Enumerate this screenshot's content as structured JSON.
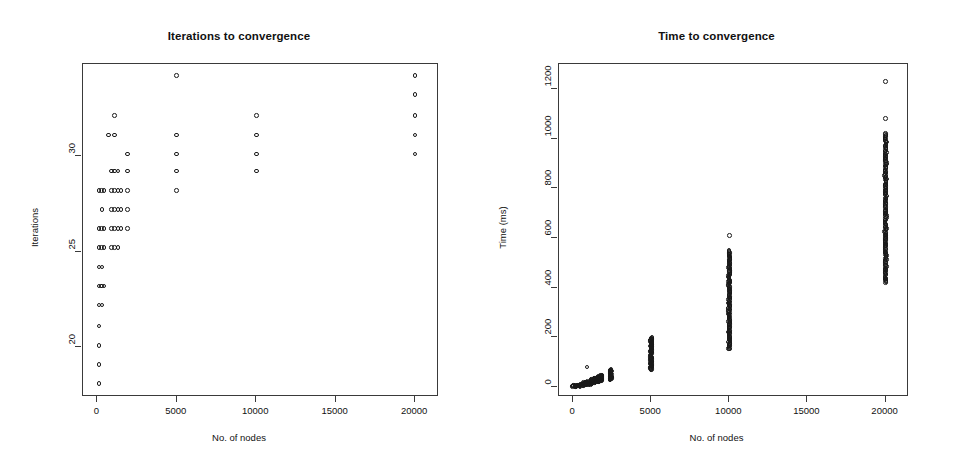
{
  "figure": {
    "background": "#ffffff",
    "point_color": "#191919",
    "axis_color": "#3a3a3a",
    "marker": "open-circle"
  },
  "chart_data": [
    {
      "type": "scatter",
      "title": "Iterations to convergence",
      "xlabel": "No. of nodes",
      "ylabel": "Iterations",
      "xlim": [
        -900,
        21500
      ],
      "ylim": [
        17.4,
        34.8
      ],
      "xticks": [
        0,
        5000,
        10000,
        15000,
        20000
      ],
      "xticklabels": [
        "0",
        "5000",
        "10000",
        "15000",
        "20000"
      ],
      "yticks": [
        20,
        25,
        30
      ],
      "yticklabels": [
        "20",
        "25",
        "30"
      ],
      "grid": false,
      "legend": null,
      "points": [
        [
          100,
          18.1
        ],
        [
          100,
          19.1
        ],
        [
          100,
          20.1
        ],
        [
          100,
          21.1
        ],
        [
          100,
          22.2
        ],
        [
          300,
          22.2
        ],
        [
          100,
          23.2
        ],
        [
          250,
          23.2
        ],
        [
          420,
          23.2
        ],
        [
          100,
          24.2
        ],
        [
          300,
          24.2
        ],
        [
          100,
          25.2
        ],
        [
          250,
          25.2
        ],
        [
          420,
          25.2
        ],
        [
          900,
          25.2
        ],
        [
          1100,
          25.2
        ],
        [
          1300,
          25.2
        ],
        [
          100,
          26.2
        ],
        [
          250,
          26.2
        ],
        [
          420,
          26.2
        ],
        [
          900,
          26.2
        ],
        [
          1100,
          26.2
        ],
        [
          1300,
          26.2
        ],
        [
          1500,
          26.2
        ],
        [
          1900,
          26.2
        ],
        [
          300,
          27.2
        ],
        [
          900,
          27.2
        ],
        [
          1100,
          27.2
        ],
        [
          1300,
          27.2
        ],
        [
          1500,
          27.2
        ],
        [
          1900,
          27.2
        ],
        [
          100,
          28.2
        ],
        [
          250,
          28.2
        ],
        [
          420,
          28.2
        ],
        [
          900,
          28.2
        ],
        [
          1100,
          28.2
        ],
        [
          1300,
          28.2
        ],
        [
          1500,
          28.2
        ],
        [
          1900,
          28.2
        ],
        [
          5000,
          28.2
        ],
        [
          900,
          29.2
        ],
        [
          1100,
          29.2
        ],
        [
          1300,
          29.2
        ],
        [
          1900,
          29.2
        ],
        [
          5000,
          29.2
        ],
        [
          10000,
          29.2
        ],
        [
          1900,
          30.1
        ],
        [
          5000,
          30.1
        ],
        [
          10000,
          30.1
        ],
        [
          20000,
          30.1
        ],
        [
          700,
          31.1
        ],
        [
          1100,
          31.1
        ],
        [
          5000,
          31.1
        ],
        [
          10000,
          31.1
        ],
        [
          20000,
          31.1
        ],
        [
          1100,
          32.1
        ],
        [
          10000,
          32.1
        ],
        [
          20000,
          32.1
        ],
        [
          20000,
          33.2
        ],
        [
          5000,
          34.2
        ],
        [
          20000,
          34.2
        ]
      ]
    },
    {
      "type": "scatter",
      "title": "Time to convergence",
      "xlabel": "No. of nodes",
      "ylabel": "Time (ms)",
      "xlim": [
        -900,
        21500
      ],
      "ylim": [
        -40,
        1300
      ],
      "xticks": [
        0,
        5000,
        10000,
        15000,
        20000
      ],
      "xticklabels": [
        "0",
        "5000",
        "10000",
        "15000",
        "20000"
      ],
      "yticks": [
        0,
        200,
        400,
        600,
        800,
        1000,
        1200
      ],
      "yticklabels": [
        "0",
        "200",
        "400",
        "600",
        "800",
        "1000",
        "1200"
      ],
      "grid": false,
      "legend": null,
      "clusters": [
        {
          "x": 100,
          "ymin": 2,
          "ymax": 6,
          "n": 10,
          "dense": false
        },
        {
          "x": 300,
          "ymin": 3,
          "ymax": 9,
          "n": 10,
          "dense": false
        },
        {
          "x": 500,
          "ymin": 5,
          "ymax": 12,
          "n": 10,
          "dense": false
        },
        {
          "x": 800,
          "ymin": 8,
          "ymax": 18,
          "n": 14,
          "dense": false
        },
        {
          "x": 1000,
          "ymin": 10,
          "ymax": 22,
          "n": 16,
          "dense": false
        },
        {
          "x": 1200,
          "ymin": 14,
          "ymax": 30,
          "n": 20,
          "dense": true
        },
        {
          "x": 1400,
          "ymin": 18,
          "ymax": 36,
          "n": 22,
          "dense": true
        },
        {
          "x": 1600,
          "ymin": 20,
          "ymax": 42,
          "n": 24,
          "dense": true
        },
        {
          "x": 1800,
          "ymin": 24,
          "ymax": 48,
          "n": 24,
          "dense": true
        },
        {
          "x": 2400,
          "ymin": 30,
          "ymax": 70,
          "n": 34,
          "dense": true
        },
        {
          "x": 5000,
          "ymin": 70,
          "ymax": 200,
          "n": 70,
          "dense": true
        },
        {
          "x": 10000,
          "ymin": 152,
          "ymax": 548,
          "n": 120,
          "dense": true
        },
        {
          "x": 20000,
          "ymin": 420,
          "ymax": 1020,
          "n": 150,
          "dense": true
        }
      ],
      "outliers": [
        [
          900,
          80
        ],
        [
          10000,
          610
        ],
        [
          20000,
          1080
        ],
        [
          20000,
          1230
        ]
      ]
    }
  ]
}
